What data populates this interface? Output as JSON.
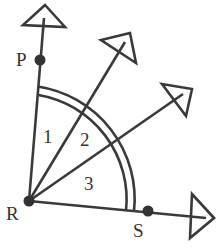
{
  "diagram": {
    "vertex": {
      "label": "R",
      "x": 29,
      "y": 201
    },
    "points": [
      {
        "label": "P",
        "x": 40,
        "y": 60
      },
      {
        "label": "S",
        "x": 148,
        "y": 211
      }
    ],
    "angle_labels": [
      {
        "label": "1",
        "x": 49,
        "y": 143
      },
      {
        "label": "2",
        "x": 86,
        "y": 145
      },
      {
        "label": "3",
        "x": 91,
        "y": 189
      }
    ],
    "colors": {
      "stroke": "#3a3a3a",
      "point": "#333333",
      "background": "#ffffff"
    }
  }
}
